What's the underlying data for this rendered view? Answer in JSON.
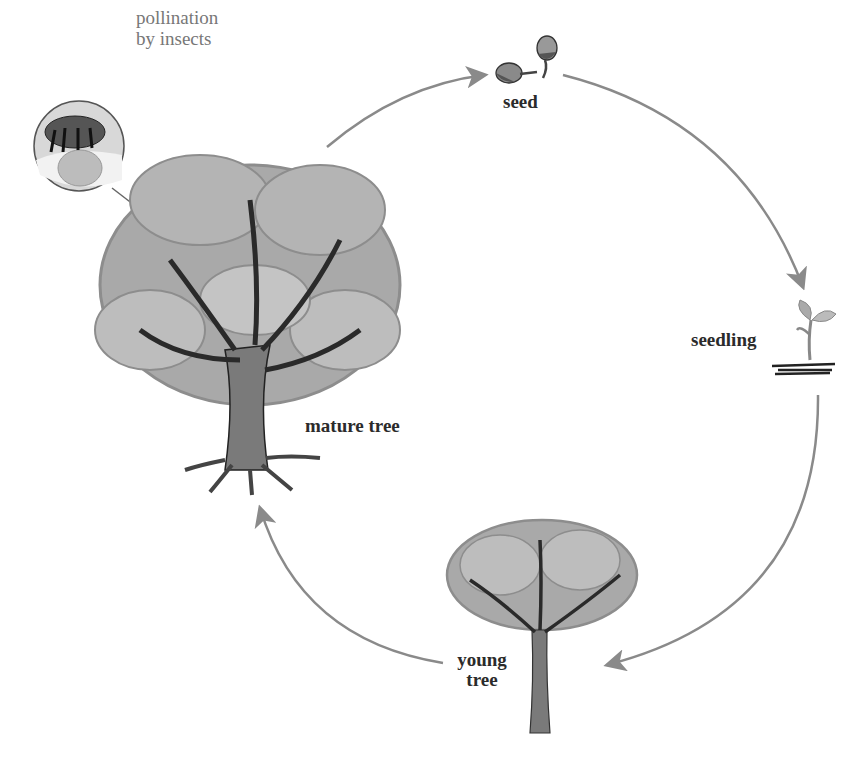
{
  "diagram": {
    "stages": [
      {
        "id": "seed",
        "label": "seed"
      },
      {
        "id": "seedling",
        "label": "seedling"
      },
      {
        "id": "young-tree",
        "label_line1": "young",
        "label_line2": "tree"
      },
      {
        "id": "mature-tree",
        "label": "mature tree"
      }
    ],
    "annotation": {
      "line1": "pollination",
      "line2": "by insects"
    },
    "arrows": [
      {
        "from": "mature tree",
        "to": "seed"
      },
      {
        "from": "seed",
        "to": "seedling"
      },
      {
        "from": "seedling",
        "to": "young tree"
      },
      {
        "from": "young tree",
        "to": "mature tree"
      }
    ],
    "colors": {
      "arrow": "#8a8a8a",
      "foliage": "#a9a9a9",
      "foliage_light": "#c4c4c4",
      "branches": "#2a2a2a",
      "trunk": "#7a7a7a",
      "text": "#2b2b2b",
      "note_text": "#777777"
    }
  }
}
